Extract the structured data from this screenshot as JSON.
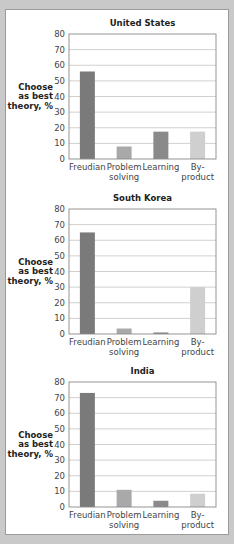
{
  "chart_data": [
    {
      "type": "bar",
      "title": "United States",
      "ylabel": [
        "Choose",
        "as best",
        "theory, %"
      ],
      "xlabel": "",
      "categories": [
        [
          "Freudian"
        ],
        [
          "Problem",
          "solving"
        ],
        [
          "Learning"
        ],
        [
          "By-",
          "product"
        ]
      ],
      "values": [
        56,
        8,
        17.5,
        17.5
      ],
      "ylim": [
        0,
        80
      ],
      "yticks": [
        0,
        10,
        20,
        30,
        40,
        50,
        60,
        70,
        80
      ],
      "grid": true,
      "colors": [
        "#7a7a7a",
        "#a9a9a9",
        "#8a8a8a",
        "#cfcfcf"
      ]
    },
    {
      "type": "bar",
      "title": "South Korea",
      "ylabel": [
        "Choose",
        "as best",
        "theory, %"
      ],
      "xlabel": "",
      "categories": [
        [
          "Freudian"
        ],
        [
          "Problem",
          "solving"
        ],
        [
          "Learning"
        ],
        [
          "By-",
          "product"
        ]
      ],
      "values": [
        65,
        3.5,
        1,
        30
      ],
      "ylim": [
        0,
        80
      ],
      "yticks": [
        0,
        10,
        20,
        30,
        40,
        50,
        60,
        70,
        80
      ],
      "grid": true,
      "colors": [
        "#7a7a7a",
        "#a9a9a9",
        "#8a8a8a",
        "#cfcfcf"
      ]
    },
    {
      "type": "bar",
      "title": "India",
      "ylabel": [
        "Choose",
        "as best",
        "theory, %"
      ],
      "xlabel": "",
      "categories": [
        [
          "Freudian"
        ],
        [
          "Problem",
          "solving"
        ],
        [
          "Learning"
        ],
        [
          "By-",
          "product"
        ]
      ],
      "values": [
        73,
        11,
        4,
        8.5
      ],
      "ylim": [
        0,
        80
      ],
      "yticks": [
        0,
        10,
        20,
        30,
        40,
        50,
        60,
        70,
        80
      ],
      "grid": true,
      "colors": [
        "#7a7a7a",
        "#a9a9a9",
        "#8a8a8a",
        "#cfcfcf"
      ]
    }
  ]
}
